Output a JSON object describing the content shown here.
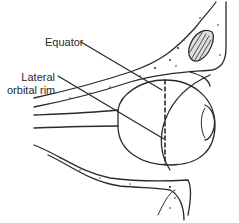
{
  "diagram": {
    "labels": [
      {
        "id": "equator",
        "text": "Equator"
      },
      {
        "id": "lateral-orbital-rim",
        "line1": "Lateral",
        "line2": "orbital rim"
      }
    ],
    "colors": {
      "stroke": "#2a2a2a",
      "background": "#ffffff"
    }
  }
}
